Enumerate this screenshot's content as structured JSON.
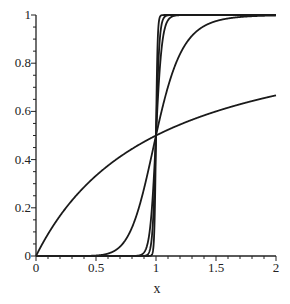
{
  "chart_data": {
    "type": "line",
    "title": "",
    "xlabel": "x",
    "ylabel": "",
    "xlim": [
      0,
      2
    ],
    "ylim": [
      0,
      1
    ],
    "grid": false,
    "legend": null,
    "x_ticks": [
      0,
      0.5,
      1,
      1.5,
      2
    ],
    "x_tick_labels": [
      "0",
      "0.5",
      "1",
      "1.5",
      "2"
    ],
    "x_minor_step": 0.1,
    "y_ticks": [
      0,
      0.2,
      0.4,
      0.6,
      0.8,
      1
    ],
    "y_tick_labels": [
      "0",
      "0.2",
      "0.4",
      "0.6",
      "0.8",
      "1"
    ],
    "y_minor_step": 0.05,
    "series": [
      {
        "name": "n=1",
        "n": 1,
        "x": [
          0,
          0.25,
          0.5,
          0.75,
          1,
          1.25,
          1.5,
          1.75,
          2
        ],
        "y": [
          0,
          0.2,
          0.33,
          0.43,
          0.5,
          0.56,
          0.6,
          0.64,
          0.67
        ]
      },
      {
        "name": "n=9",
        "n": 9,
        "x": [
          0.5,
          0.75,
          0.9,
          1,
          1.1,
          1.25,
          1.5,
          2
        ],
        "y": [
          0.002,
          0.07,
          0.28,
          0.5,
          0.7,
          0.88,
          0.97,
          1.0
        ]
      },
      {
        "name": "n=40",
        "n": 40,
        "x": [
          0.9,
          0.95,
          1,
          1.05,
          1.1,
          2
        ],
        "y": [
          0.01,
          0.11,
          0.5,
          0.88,
          0.98,
          1.0
        ]
      },
      {
        "name": "n=70",
        "n": 70,
        "x": [
          0.93,
          0.97,
          1,
          1.03,
          1.07,
          2
        ],
        "y": [
          0.01,
          0.1,
          0.5,
          0.89,
          0.99,
          1.0
        ]
      },
      {
        "name": "n=150",
        "n": 150,
        "x": [
          0.97,
          0.99,
          1,
          1.01,
          1.03,
          2
        ],
        "y": [
          0.01,
          0.18,
          0.5,
          0.82,
          0.99,
          1.0
        ]
      }
    ],
    "line_color": "#1a1a1a"
  }
}
